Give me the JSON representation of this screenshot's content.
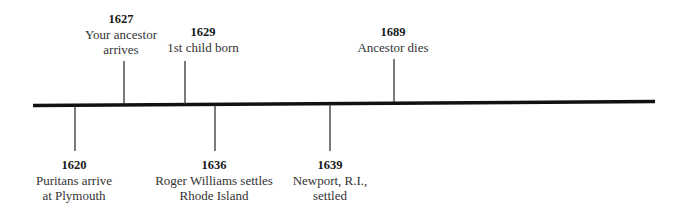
{
  "timeline": {
    "colors": {
      "line": "#111111",
      "tick": "#333333",
      "text": "#333333"
    },
    "events_above": [
      {
        "year": "1627",
        "desc_line1": "Your ancestor",
        "desc_line2": "arrives"
      },
      {
        "year": "1629",
        "desc_line1": "1st child born",
        "desc_line2": ""
      },
      {
        "year": "1689",
        "desc_line1": "Ancestor dies",
        "desc_line2": ""
      }
    ],
    "events_below": [
      {
        "year": "1620",
        "desc_line1": "Puritans arrive",
        "desc_line2": "at Plymouth"
      },
      {
        "year": "1636",
        "desc_line1": "Roger Williams settles",
        "desc_line2": "Rhode Island"
      },
      {
        "year": "1639",
        "desc_line1": "Newport, R.I.,",
        "desc_line2": "settled"
      }
    ]
  }
}
